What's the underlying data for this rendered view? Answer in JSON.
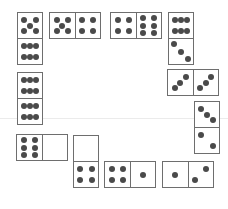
{
  "puzzle": {
    "description": "Domino arrangement",
    "guide_line_y": 118,
    "pip_color": "#4a4a4a",
    "border_color": "#6e6e6e",
    "dominoes": [
      {
        "id": 1,
        "orientation": "v",
        "x": 17,
        "y": 12,
        "values": [
          5,
          6
        ]
      },
      {
        "id": 2,
        "orientation": "h",
        "x": 49,
        "y": 12,
        "values": [
          5,
          4
        ]
      },
      {
        "id": 3,
        "orientation": "h",
        "x": 110,
        "y": 12,
        "values": [
          4,
          6
        ]
      },
      {
        "id": 4,
        "orientation": "v",
        "x": 168,
        "y": 12,
        "values": [
          6,
          3
        ]
      },
      {
        "id": 5,
        "orientation": "h",
        "x": 167,
        "y": 69,
        "values": [
          3,
          3
        ]
      },
      {
        "id": 6,
        "orientation": "v",
        "x": 194,
        "y": 101,
        "values": [
          3,
          2
        ]
      },
      {
        "id": 7,
        "orientation": "v",
        "x": 17,
        "y": 72,
        "values": [
          6,
          6
        ]
      },
      {
        "id": 8,
        "orientation": "h",
        "x": 16,
        "y": 134,
        "values": [
          6,
          0
        ]
      },
      {
        "id": 9,
        "orientation": "v",
        "x": 73,
        "y": 135,
        "values": [
          0,
          4
        ]
      },
      {
        "id": 10,
        "orientation": "h",
        "x": 104,
        "y": 161,
        "values": [
          4,
          1
        ]
      },
      {
        "id": 11,
        "orientation": "h",
        "x": 162,
        "y": 161,
        "values": [
          1,
          2
        ]
      }
    ]
  }
}
